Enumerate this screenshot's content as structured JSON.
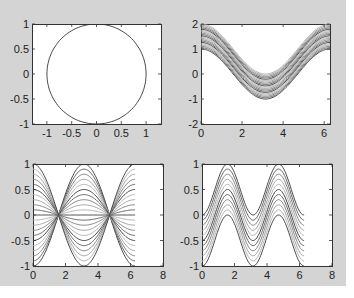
{
  "figure": {
    "background": "#d4d4d4",
    "axes_background": "#ffffff"
  },
  "chart_data": [
    {
      "id": "top-left",
      "type": "line",
      "title": "",
      "description": "Unit circle (x = cos t, y = sin t)",
      "xlabel": "",
      "ylabel": "",
      "xlim": [
        -1.3,
        1.3
      ],
      "ylim": [
        -1,
        1
      ],
      "xticks": [
        -1,
        -0.5,
        0,
        0.5,
        1
      ],
      "xtick_labels": [
        "-1",
        "-0.5",
        "0",
        "0.5",
        "1"
      ],
      "yticks": [
        -1,
        -0.5,
        0,
        0.5,
        1
      ],
      "ytick_labels": [
        "-1",
        "-0.5",
        "0",
        "0.5",
        "1"
      ],
      "series": [
        {
          "name": "circle",
          "function": "circle",
          "params": [
            1
          ]
        }
      ],
      "grid": false,
      "box": [
        32,
        24,
        161,
        124
      ]
    },
    {
      "id": "top-right",
      "type": "line",
      "title": "",
      "description": "Family y = cos(x) + k, k from 0 to 1 (20 curves)",
      "xlabel": "",
      "ylabel": "",
      "xlim": [
        0,
        6.2832
      ],
      "ylim": [
        -2,
        2
      ],
      "xticks": [
        0,
        2,
        4,
        6
      ],
      "xtick_labels": [
        "0",
        "2",
        "4",
        "6"
      ],
      "yticks": [
        -2,
        -1,
        0,
        1,
        2
      ],
      "ytick_labels": [
        "-2",
        "-1",
        "0",
        "1",
        "2"
      ],
      "series": [
        {
          "name": "cos+k",
          "function": "cos_offset",
          "params": [
            0,
            0.0526,
            0.1053,
            0.1579,
            0.2105,
            0.2632,
            0.3158,
            0.3684,
            0.4211,
            0.4737,
            0.5263,
            0.5789,
            0.6316,
            0.6842,
            0.7368,
            0.7895,
            0.8421,
            0.8947,
            0.9474,
            1.0
          ]
        }
      ],
      "grid": false,
      "box": [
        201,
        24,
        330,
        124
      ]
    },
    {
      "id": "bottom-left",
      "type": "line",
      "title": "",
      "description": "Family y = a*cos(x), a from -1 to 1 (21 curves), x in [0, 2π]",
      "xlabel": "",
      "ylabel": "",
      "xlim": [
        0,
        8
      ],
      "ylim": [
        -1,
        1
      ],
      "xticks": [
        0,
        2,
        4,
        6,
        8
      ],
      "xtick_labels": [
        "0",
        "2",
        "4",
        "6",
        "8"
      ],
      "yticks": [
        -1,
        -0.5,
        0,
        0.5,
        1
      ],
      "ytick_labels": [
        "-1",
        "-0.5",
        "0",
        "0.5",
        "1"
      ],
      "series": [
        {
          "name": "a*cos",
          "function": "cos_scale",
          "params": [
            -1,
            -0.9,
            -0.8,
            -0.7,
            -0.6,
            -0.5,
            -0.4,
            -0.3,
            -0.2,
            -0.1,
            0,
            0.1,
            0.2,
            0.3,
            0.4,
            0.5,
            0.6,
            0.7,
            0.8,
            0.9,
            1
          ]
        }
      ],
      "grid": false,
      "box": [
        33,
        164,
        163,
        266
      ]
    },
    {
      "id": "bottom-right",
      "type": "line",
      "title": "",
      "description": "Family y = sin^2(x) - k, k from 0 to 1 (11 curves), x in [0, 2π]",
      "xlabel": "",
      "ylabel": "",
      "xlim": [
        0,
        8
      ],
      "ylim": [
        -1,
        1
      ],
      "xticks": [
        0,
        2,
        4,
        6,
        8
      ],
      "xtick_labels": [
        "0",
        "2",
        "4",
        "6",
        "8"
      ],
      "yticks": [
        -1,
        -0.5,
        0,
        0.5,
        1
      ],
      "ytick_labels": [
        "-1",
        "-0.5",
        "0",
        "0.5",
        "1"
      ],
      "series": [
        {
          "name": "sin^2-k",
          "function": "sin2_offset",
          "params": [
            0,
            0.1,
            0.2,
            0.3,
            0.4,
            0.5,
            0.6,
            0.7,
            0.8,
            0.9,
            1.0
          ]
        }
      ],
      "grid": false,
      "box": [
        202,
        164,
        332,
        266
      ]
    }
  ]
}
